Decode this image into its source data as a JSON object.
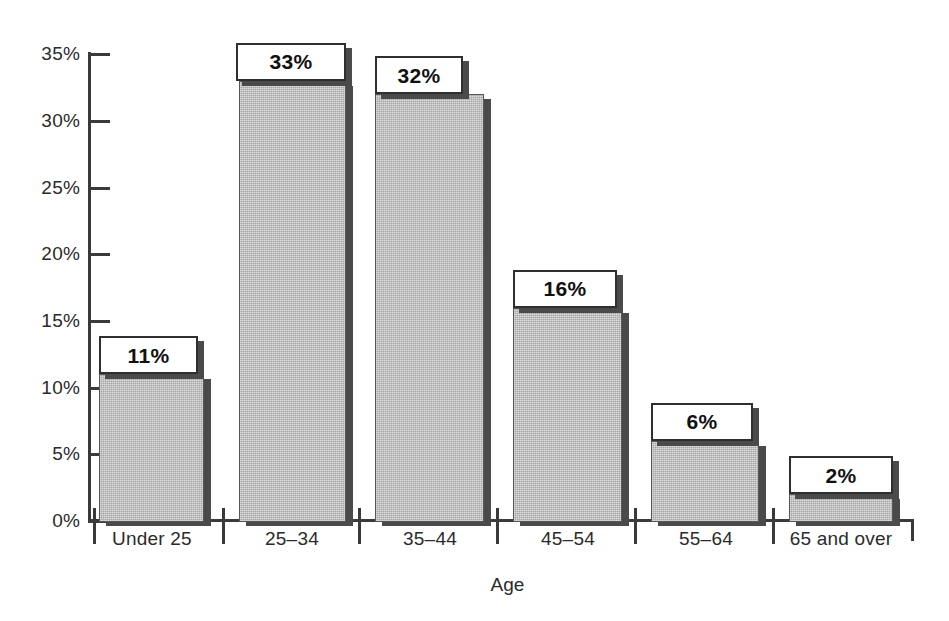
{
  "chart_data": {
    "type": "bar",
    "title": "",
    "xlabel": "Age",
    "ylabel": "",
    "categories": [
      "Under 25",
      "25–34",
      "35–44",
      "45–54",
      "55–64",
      "65 and over"
    ],
    "values": [
      11,
      33,
      32,
      16,
      6,
      2
    ],
    "value_labels": [
      "11%",
      "33%",
      "32%",
      "16%",
      "6%",
      "2%"
    ],
    "ylim": [
      0,
      35
    ],
    "ytick_values": [
      0,
      5,
      10,
      15,
      20,
      25,
      30,
      35
    ],
    "ytick_labels": [
      "0%",
      "5%",
      "10%",
      "15%",
      "20%",
      "25%",
      "30%",
      "35%"
    ],
    "grid": false,
    "legend": null,
    "bar_color": "#b6b6b6",
    "bar_edge_color": "#575757",
    "shadow_color": "#4a4a4a",
    "axis_color": "#3a3a3a",
    "text_color": "#2b2b2b"
  },
  "axis": {
    "y_title": "",
    "x_title": "Age"
  },
  "geometry": {
    "baseline_y": 521,
    "axis_x": 89,
    "axis_right": 912,
    "px_per_percent": 13.34,
    "bars": [
      {
        "left": 99,
        "width": 105,
        "label_box_left": 99,
        "label_box_width": 99,
        "label_box_height": 38
      },
      {
        "left": 239,
        "width": 107,
        "label_box_left": 236,
        "label_box_width": 110,
        "label_box_height": 38
      },
      {
        "left": 375,
        "width": 109,
        "label_box_left": 375,
        "label_box_width": 88,
        "label_box_height": 38
      },
      {
        "left": 513,
        "width": 109,
        "label_box_left": 513,
        "label_box_width": 104,
        "label_box_height": 38
      },
      {
        "left": 651,
        "width": 108,
        "label_box_left": 651,
        "label_box_width": 102,
        "label_box_height": 38
      },
      {
        "left": 789,
        "width": 104,
        "label_box_left": 789,
        "label_box_width": 104,
        "label_box_height": 38
      }
    ],
    "x_ticks": [
      93,
      222,
      358,
      496,
      634,
      772,
      911
    ],
    "category_centers": [
      152,
      292,
      430,
      568,
      706,
      841
    ]
  }
}
